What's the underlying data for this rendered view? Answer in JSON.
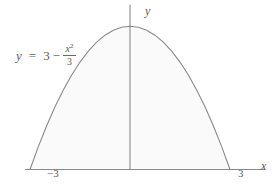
{
  "figure": {
    "background_color": "#ffffff",
    "width": 280,
    "height": 191
  },
  "equation": {
    "lhs": "y",
    "relation": "=",
    "constant": "3",
    "operator": "−",
    "numerator": "x",
    "numerator_exponent": "2",
    "denominator": "3",
    "full_text": "y = 3 − x²/3"
  },
  "axes": {
    "x_axis_label": "x",
    "y_axis_label": "y",
    "x_ticks": [
      {
        "label": "−3",
        "value": -3
      },
      {
        "label": "3",
        "value": 3
      }
    ],
    "line_color": "#8a8a8a"
  },
  "chart_data": {
    "type": "line",
    "title": "",
    "subtitle": "",
    "xlabel": "x",
    "ylabel": "y",
    "function": "y = 3 - x^2/3",
    "grid": false,
    "legend": false,
    "legend_position": "none",
    "fill": true,
    "fill_color": "#fafafa",
    "line_color": "#8a8a8a",
    "xlim": [
      -3.9,
      4.5
    ],
    "ylim": [
      -0.45,
      3.55
    ],
    "roots": [
      -3,
      3
    ],
    "vertex": [
      0,
      3
    ],
    "annotations": [
      {
        "text": "y = 3 − x²/3",
        "x": -2.9,
        "y": 2.35
      }
    ],
    "x": [
      -3,
      -2.75,
      -2.5,
      -2.25,
      -2,
      -1.75,
      -1.5,
      -1.25,
      -1,
      -0.75,
      -0.5,
      -0.25,
      0,
      0.25,
      0.5,
      0.75,
      1,
      1.25,
      1.5,
      1.75,
      2,
      2.25,
      2.5,
      2.75,
      3
    ],
    "y": [
      0,
      0.479,
      0.917,
      1.313,
      1.667,
      1.979,
      2.25,
      2.479,
      2.667,
      2.813,
      2.917,
      2.979,
      3,
      2.979,
      2.917,
      2.813,
      2.667,
      2.479,
      2.25,
      1.979,
      1.667,
      1.313,
      0.917,
      0.479,
      0
    ]
  }
}
